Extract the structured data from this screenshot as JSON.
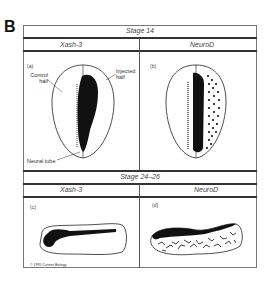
{
  "figure": {
    "letter": "B",
    "copyright": "© 1995 Current Biology"
  },
  "top_section": {
    "stage_label": "Stage 14",
    "columns": [
      "Xash-3",
      "NeuroD"
    ],
    "panels": [
      {
        "label": "(a)",
        "annotations": [
          "Control half",
          "Injected half",
          "Neural tube"
        ]
      },
      {
        "label": "(b)"
      }
    ]
  },
  "bottom_section": {
    "stage_label": "Stage 24–26",
    "columns": [
      "Xash-3",
      "NeuroD"
    ],
    "panels": [
      {
        "label": "(c)"
      },
      {
        "label": "(d)"
      }
    ]
  },
  "colors": {
    "ink": "#111111",
    "line": "#555555",
    "background": "#ffffff"
  }
}
